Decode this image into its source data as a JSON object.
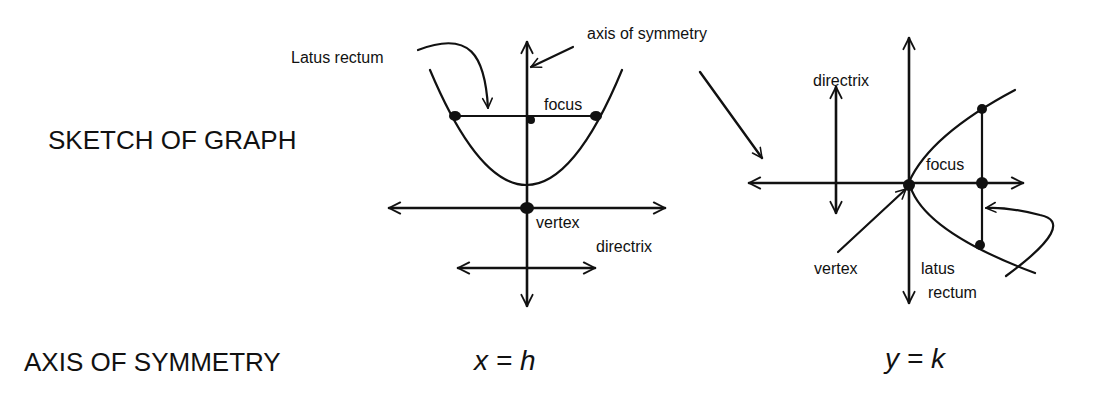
{
  "rows": {
    "sketch_label": "SKETCH OF GRAPH",
    "axis_label": "AXIS OF SYMMETRY"
  },
  "left_graph": {
    "orientation": "vertical (opens up)",
    "labels": {
      "latus_rectum": "Latus rectum",
      "axis_of_symmetry": "axis of symmetry",
      "focus": "focus",
      "vertex": "vertex",
      "directrix": "directrix"
    },
    "equation": "x = h"
  },
  "right_graph": {
    "orientation": "horizontal (opens right)",
    "labels": {
      "directrix": "directrix",
      "focus": "focus",
      "vertex": "vertex",
      "latus_rectum_line1": "latus",
      "latus_rectum_line2": "rectum"
    },
    "equation": "y = k"
  },
  "colors": {
    "ink": "#111111",
    "background": "#ffffff"
  }
}
